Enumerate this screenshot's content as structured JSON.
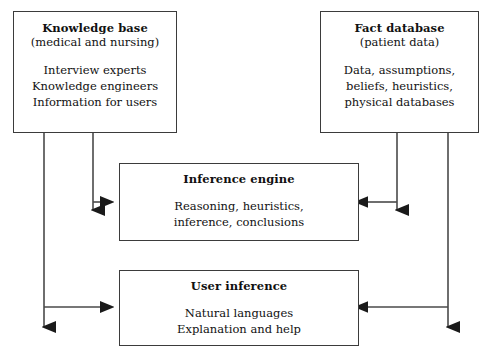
{
  "diagram": {
    "type": "block-flow-diagram",
    "background_color": "#ffffff",
    "line_color": "#4a4a4a",
    "border_color": "#3b3b3b",
    "text_color": "#111111",
    "nodes": {
      "knowledge_base": {
        "title": "Knowledge base",
        "subtitle": "(medical and nursing)",
        "body": [
          "Interview experts",
          "Knowledge engineers",
          "Information for users"
        ]
      },
      "fact_database": {
        "title": "Fact database",
        "subtitle": "(patient data)",
        "body": [
          "Data, assumptions,",
          "beliefs, heuristics,",
          "physical databases"
        ]
      },
      "inference_engine": {
        "title": "Inference engine",
        "subtitle": "",
        "body": [
          "Reasoning, heuristics,",
          "inference, conclusions"
        ]
      },
      "user_inference": {
        "title": "User inference",
        "subtitle": "",
        "body": [
          "Natural languages",
          "Explanation and help"
        ]
      }
    },
    "connectors": [
      {
        "name": "knowledge-base-to-inference-engine",
        "from": "knowledge_base",
        "to": "inference_engine",
        "direction": "right",
        "arrowhead": true
      },
      {
        "name": "knowledge-base-inner-down",
        "from": "knowledge_base",
        "to": "",
        "direction": "down",
        "arrowhead": true
      },
      {
        "name": "knowledge-base-to-user-inference",
        "from": "knowledge_base",
        "to": "user_inference",
        "direction": "right",
        "arrowhead": true
      },
      {
        "name": "knowledge-base-outer-down",
        "from": "knowledge_base",
        "to": "",
        "direction": "down",
        "arrowhead": true
      },
      {
        "name": "fact-database-to-inference-engine",
        "from": "fact_database",
        "to": "inference_engine",
        "direction": "left",
        "arrowhead": true
      },
      {
        "name": "fact-database-inner-down",
        "from": "fact_database",
        "to": "",
        "direction": "down",
        "arrowhead": true
      },
      {
        "name": "fact-database-to-user-inference",
        "from": "fact_database",
        "to": "user_inference",
        "direction": "left",
        "arrowhead": true
      },
      {
        "name": "fact-database-outer-down",
        "from": "fact_database",
        "to": "",
        "direction": "down",
        "arrowhead": true
      }
    ]
  }
}
